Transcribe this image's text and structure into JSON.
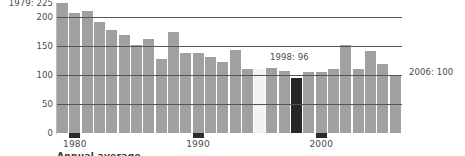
{
  "chart_data": {
    "type": "bar",
    "title": "",
    "subtitle": "",
    "xlabel": "",
    "ylabel": "",
    "ylim": [
      0,
      225
    ],
    "xlim_years": [
      1979,
      2006
    ],
    "grid": true,
    "gridlines": [
      50,
      100,
      150,
      200
    ],
    "legend_position": "none",
    "categories": [
      "1979",
      "1980",
      "1981",
      "1982",
      "1983",
      "1984",
      "1985",
      "1986",
      "1987",
      "1988",
      "1989",
      "1990",
      "1991",
      "1992",
      "1993",
      "1994",
      "1995",
      "1996",
      "1997",
      "1998",
      "1999",
      "2000",
      "2001",
      "2002",
      "2003",
      "2004",
      "2005",
      "2006"
    ],
    "values": [
      225,
      208,
      212,
      192,
      179,
      170,
      152,
      163,
      128,
      175,
      138,
      138,
      132,
      123,
      143,
      110,
      110,
      112,
      108,
      96,
      105,
      106,
      110,
      152,
      110,
      142,
      120,
      100
    ],
    "bar_styles": [
      "normal",
      "normal",
      "normal",
      "normal",
      "normal",
      "normal",
      "normal",
      "normal",
      "normal",
      "normal",
      "normal",
      "normal",
      "normal",
      "normal",
      "normal",
      "normal",
      "light",
      "normal",
      "normal",
      "dark",
      "normal",
      "normal",
      "normal",
      "normal",
      "normal",
      "normal",
      "normal",
      "normal"
    ],
    "annotations": [
      {
        "id": "first-value",
        "text": "1979: 225",
        "value": 225,
        "category": "1979"
      },
      {
        "id": "min-value",
        "text": "1998: 96",
        "value": 96,
        "category": "1998"
      },
      {
        "id": "last-value",
        "text": "2006: 100",
        "value": 100,
        "category": "2006"
      }
    ],
    "colors": {
      "bar": "#a0a0a0",
      "bar_light": "#f2f2f0",
      "bar_dark": "#262626",
      "gridline": "#555555",
      "axis": "#b9b9b9",
      "text": "#4a4a4a",
      "background": "#ffffff"
    }
  },
  "y_axis": {
    "ticks": [
      {
        "value": 225,
        "label": "1979: 225"
      },
      {
        "value": 200,
        "label": "200"
      },
      {
        "value": 150,
        "label": "150"
      },
      {
        "value": 100,
        "label": "100"
      },
      {
        "value": 50,
        "label": "50"
      },
      {
        "value": 0,
        "label": "0"
      }
    ]
  },
  "x_axis": {
    "ticks": [
      {
        "category": "1980",
        "label": "1980"
      },
      {
        "category": "1990",
        "label": "1990"
      },
      {
        "category": "2000",
        "label": "2000"
      }
    ]
  },
  "annotations": {
    "left_top": "1979: 225",
    "middle": "1998: 96",
    "right": "2006: 100"
  },
  "caption": {
    "clipped_text": "Annual average"
  }
}
